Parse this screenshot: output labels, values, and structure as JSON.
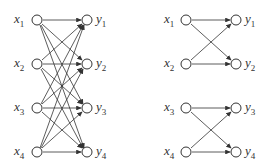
{
  "diagrams": [
    {
      "name": "fully-connected",
      "inputs": [
        "x",
        "x",
        "x",
        "x"
      ],
      "input_subs": [
        "1",
        "2",
        "3",
        "4"
      ],
      "outputs": [
        "y",
        "y",
        "y",
        "y"
      ],
      "output_subs": [
        "1",
        "2",
        "3",
        "4"
      ]
    },
    {
      "name": "butterfly-pairs",
      "inputs": [
        "x",
        "x",
        "x",
        "x"
      ],
      "input_subs": [
        "1",
        "2",
        "3",
        "4"
      ],
      "outputs": [
        "y",
        "y",
        "y",
        "y"
      ],
      "output_subs": [
        "1",
        "2",
        "3",
        "4"
      ]
    }
  ],
  "colors": {
    "stroke": "#333333",
    "text": "#333333"
  }
}
